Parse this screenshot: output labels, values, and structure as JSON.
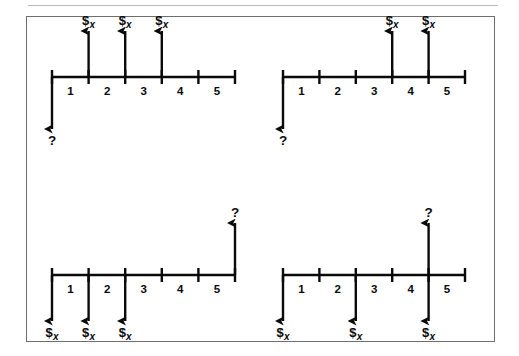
{
  "figure": {
    "type": "cash-flow-timeline-diagram",
    "panel_count": 4,
    "cash_flow_label": "$",
    "cash_flow_subscript": "x",
    "unknown_label": "?",
    "period_labels": [
      "1",
      "2",
      "3",
      "4",
      "5"
    ],
    "ink_color": "#0a0a0a",
    "frame_color": "#6e6e6e",
    "rule_color": "#b9b9b9",
    "background_color": "#ffffff"
  },
  "panels": [
    {
      "id": "panel-top-left",
      "name": "top-left-timeline",
      "axis": {
        "x_start": 52,
        "x_end": 235,
        "y": 77,
        "period_span": 5
      },
      "ticks": [
        0,
        1,
        2,
        3,
        4,
        5
      ],
      "period_labels": [
        "1",
        "2",
        "3",
        "4",
        "5"
      ],
      "arrows": [
        {
          "time": 0,
          "direction": "down",
          "label": "?",
          "kind": "unknown"
        },
        {
          "time": 1,
          "direction": "up",
          "label": "$x",
          "kind": "cash-flow"
        },
        {
          "time": 2,
          "direction": "up",
          "label": "$x",
          "kind": "cash-flow"
        },
        {
          "time": 3,
          "direction": "up",
          "label": "$x",
          "kind": "cash-flow"
        }
      ]
    },
    {
      "id": "panel-top-right",
      "name": "top-right-timeline",
      "axis": {
        "x_start": 283,
        "x_end": 465,
        "y": 77,
        "period_span": 5
      },
      "ticks": [
        0,
        1,
        2,
        3,
        4,
        5
      ],
      "period_labels": [
        "1",
        "2",
        "3",
        "4",
        "5"
      ],
      "arrows": [
        {
          "time": 0,
          "direction": "down",
          "label": "?",
          "kind": "unknown"
        },
        {
          "time": 3,
          "direction": "up",
          "label": "$x",
          "kind": "cash-flow"
        },
        {
          "time": 4,
          "direction": "up",
          "label": "$x",
          "kind": "cash-flow"
        }
      ]
    },
    {
      "id": "panel-bottom-left",
      "name": "bottom-left-timeline",
      "axis": {
        "x_start": 52,
        "x_end": 235,
        "y": 275,
        "period_span": 5
      },
      "ticks": [
        0,
        1,
        2,
        3,
        4,
        5
      ],
      "period_labels": [
        "1",
        "2",
        "3",
        "4",
        "5"
      ],
      "arrows": [
        {
          "time": 0,
          "direction": "down",
          "label": "$x",
          "kind": "cash-flow"
        },
        {
          "time": 1,
          "direction": "down",
          "label": "$x",
          "kind": "cash-flow"
        },
        {
          "time": 2,
          "direction": "down",
          "label": "$x",
          "kind": "cash-flow"
        },
        {
          "time": 5,
          "direction": "up",
          "label": "?",
          "kind": "unknown"
        }
      ]
    },
    {
      "id": "panel-bottom-right",
      "name": "bottom-right-timeline",
      "axis": {
        "x_start": 283,
        "x_end": 465,
        "y": 275,
        "period_span": 5
      },
      "ticks": [
        0,
        1,
        2,
        3,
        4,
        5
      ],
      "period_labels": [
        "1",
        "2",
        "3",
        "4",
        "5"
      ],
      "arrows": [
        {
          "time": 0,
          "direction": "down",
          "label": "$x",
          "kind": "cash-flow"
        },
        {
          "time": 2,
          "direction": "down",
          "label": "$x",
          "kind": "cash-flow"
        },
        {
          "time": 4,
          "direction": "down",
          "label": "$x",
          "kind": "cash-flow"
        },
        {
          "time": 4,
          "direction": "up",
          "label": "?",
          "kind": "unknown"
        }
      ]
    }
  ]
}
